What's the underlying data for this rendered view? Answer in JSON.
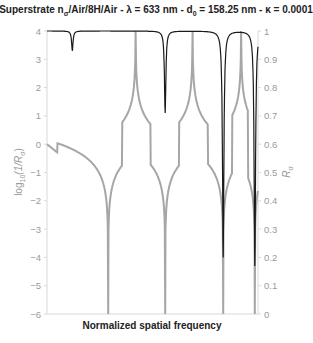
{
  "chart_data": {
    "type": "line",
    "title_parts": {
      "a": "Superstrate n",
      "a_sub": "σ",
      "b": "/Air/8H/Air - λ = 633 nm - d",
      "b_sub": "0",
      "c": " = 158.25 nm - κ = 0.0001"
    },
    "xlabel": "Normalized spatial frequency",
    "ylabel_left": "log10(1/Rσ)",
    "ylabel_left_parts": {
      "a": "log",
      "sub": "10",
      "b": "(1/R",
      "sub2": "σ",
      "c": ")"
    },
    "ylabel_right": "Rσ",
    "ylabel_right_parts": {
      "a": "R",
      "sub": "σ"
    },
    "ylim_left": [
      -6,
      4
    ],
    "ylim_right": [
      0,
      1
    ],
    "yticks_left": [
      "4",
      "3",
      "2",
      "1",
      "0",
      "-1",
      "-2",
      "-3",
      "-4",
      "-5",
      "-6"
    ],
    "yticks_right": [
      "1",
      "0.9",
      "0.8",
      "0.7",
      "0.6",
      "0.5",
      "0.4",
      "0.3",
      "0.2",
      "0.1",
      "0"
    ],
    "grid": false,
    "legend": "none",
    "series": [
      {
        "name": "log10(1/Rσ)",
        "axis": "left",
        "color": "#a0a0a0",
        "description": "Gray curve with dips to -6 near x≈0.29, 0.56, 0.83, 0.985 and asymptotic rises to +4 near x≈0.42, 0.69, 0.92",
        "dips_x_norm": [
          0.29,
          0.56,
          0.835,
          0.985
        ],
        "peaks_x_norm": [
          0.42,
          0.69,
          0.92
        ],
        "start_value": 0
      },
      {
        "name": "Rσ",
        "axis": "right",
        "color": "#222222",
        "description": "Black reflectance line near 1 with sharp resonance dips",
        "dips": [
          {
            "x_norm": 0.12,
            "min": 0.93
          },
          {
            "x_norm": 0.56,
            "min": 0.71
          },
          {
            "x_norm": 0.835,
            "min": 0.2
          },
          {
            "x_norm": 0.985,
            "min": 0.17
          }
        ],
        "baseline": 1
      }
    ]
  }
}
